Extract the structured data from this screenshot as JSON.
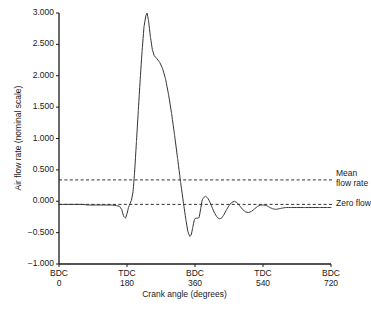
{
  "chart_data": {
    "type": "line",
    "title": "",
    "xlabel": "Crank angle (degrees)",
    "ylabel": "Air flow rate (nominal scale)",
    "xlim": [
      0,
      720
    ],
    "ylim": [
      -1.0,
      3.0
    ],
    "grid": false,
    "legend_position": "right-inline-annotations",
    "y_ticks": [
      "3.000",
      "2.500",
      "2.000",
      "1.500",
      "1.000",
      "0.500",
      "0.000",
      "-0.500",
      "-1.000"
    ],
    "y_tick_values": [
      3.0,
      2.5,
      2.0,
      1.5,
      1.0,
      0.5,
      0.0,
      -0.5,
      -1.0
    ],
    "x_ticks": [
      {
        "marker": "BDC",
        "value": "0"
      },
      {
        "marker": "TDC",
        "value": "180"
      },
      {
        "marker": "BDC",
        "value": "360"
      },
      {
        "marker": "TDC",
        "value": "540"
      },
      {
        "marker": "BDC",
        "value": "720"
      }
    ],
    "x_tick_values": [
      0,
      180,
      360,
      540,
      720
    ],
    "annotations": [
      {
        "name": "mean-flow-rate",
        "label_line1": "Mean",
        "label_line2": "flow rate",
        "y_value": 0.34,
        "style": "dashed"
      },
      {
        "name": "zero-flow",
        "label_line1": "Zero flow",
        "label_line2": "",
        "y_value": -0.05,
        "style": "dashed"
      }
    ],
    "series": [
      {
        "name": "Air flow rate",
        "color": "#333333",
        "points": [
          [
            0,
            -0.05
          ],
          [
            20,
            -0.05
          ],
          [
            40,
            -0.05
          ],
          [
            60,
            -0.05
          ],
          [
            80,
            -0.06
          ],
          [
            100,
            -0.06
          ],
          [
            120,
            -0.06
          ],
          [
            140,
            -0.06
          ],
          [
            152,
            -0.07
          ],
          [
            160,
            -0.08
          ],
          [
            166,
            -0.13
          ],
          [
            171,
            -0.24
          ],
          [
            176,
            -0.27
          ],
          [
            180,
            -0.2
          ],
          [
            184,
            -0.1
          ],
          [
            188,
            -0.04
          ],
          [
            192,
            0.02
          ],
          [
            196,
            0.15
          ],
          [
            200,
            0.45
          ],
          [
            205,
            0.95
          ],
          [
            210,
            1.45
          ],
          [
            215,
            1.95
          ],
          [
            220,
            2.4
          ],
          [
            225,
            2.78
          ],
          [
            230,
            2.96
          ],
          [
            233,
            3.0
          ],
          [
            237,
            2.88
          ],
          [
            242,
            2.62
          ],
          [
            247,
            2.42
          ],
          [
            252,
            2.32
          ],
          [
            258,
            2.28
          ],
          [
            266,
            2.22
          ],
          [
            274,
            2.12
          ],
          [
            282,
            1.95
          ],
          [
            290,
            1.7
          ],
          [
            298,
            1.4
          ],
          [
            306,
            1.05
          ],
          [
            314,
            0.68
          ],
          [
            322,
            0.3
          ],
          [
            330,
            -0.05
          ],
          [
            336,
            -0.3
          ],
          [
            341,
            -0.48
          ],
          [
            346,
            -0.56
          ],
          [
            350,
            -0.54
          ],
          [
            354,
            -0.42
          ],
          [
            358,
            -0.3
          ],
          [
            361,
            -0.27
          ],
          [
            366,
            -0.27
          ],
          [
            371,
            -0.26
          ],
          [
            375,
            -0.12
          ],
          [
            379,
            0.02
          ],
          [
            383,
            0.06
          ],
          [
            388,
            0.08
          ],
          [
            394,
            0.05
          ],
          [
            400,
            -0.02
          ],
          [
            406,
            -0.11
          ],
          [
            412,
            -0.19
          ],
          [
            418,
            -0.25
          ],
          [
            424,
            -0.28
          ],
          [
            430,
            -0.27
          ],
          [
            436,
            -0.22
          ],
          [
            443,
            -0.14
          ],
          [
            450,
            -0.07
          ],
          [
            457,
            -0.02
          ],
          [
            464,
            0.0
          ],
          [
            471,
            -0.02
          ],
          [
            478,
            -0.07
          ],
          [
            486,
            -0.13
          ],
          [
            494,
            -0.17
          ],
          [
            502,
            -0.18
          ],
          [
            510,
            -0.16
          ],
          [
            518,
            -0.12
          ],
          [
            526,
            -0.08
          ],
          [
            534,
            -0.06
          ],
          [
            542,
            -0.06
          ],
          [
            550,
            -0.07
          ],
          [
            558,
            -0.1
          ],
          [
            566,
            -0.12
          ],
          [
            574,
            -0.13
          ],
          [
            582,
            -0.12
          ],
          [
            590,
            -0.11
          ],
          [
            600,
            -0.1
          ],
          [
            615,
            -0.1
          ],
          [
            630,
            -0.1
          ],
          [
            650,
            -0.1
          ],
          [
            670,
            -0.1
          ],
          [
            690,
            -0.1
          ],
          [
            710,
            -0.1
          ],
          [
            720,
            -0.1
          ]
        ]
      }
    ]
  }
}
